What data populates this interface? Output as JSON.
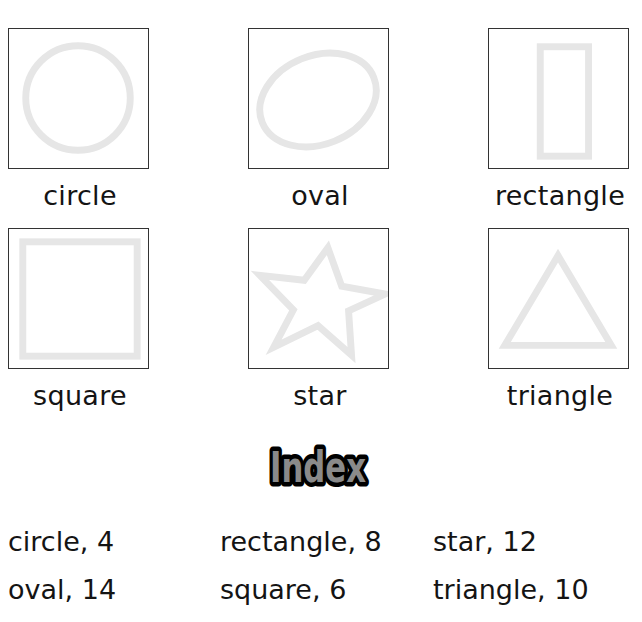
{
  "shapes": [
    {
      "name": "circle",
      "label": "circle"
    },
    {
      "name": "oval",
      "label": "oval"
    },
    {
      "name": "rectangle",
      "label": "rectangle"
    },
    {
      "name": "square",
      "label": "square"
    },
    {
      "name": "star",
      "label": "star"
    },
    {
      "name": "triangle",
      "label": "triangle"
    }
  ],
  "colors": {
    "shape_stroke": "#e6e6e6",
    "box_border": "#333333",
    "index_title_fill": "#8a8a8a",
    "index_title_outline": "#000000"
  },
  "index": {
    "title": "Index",
    "entries": [
      {
        "text": "circle, 4"
      },
      {
        "text": "rectangle, 8"
      },
      {
        "text": "star, 12"
      },
      {
        "text": "oval, 14"
      },
      {
        "text": "square, 6"
      },
      {
        "text": "triangle, 10"
      }
    ]
  }
}
